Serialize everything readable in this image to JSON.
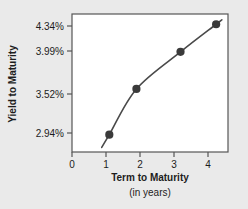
{
  "chart_data": {
    "type": "line",
    "title": "",
    "xlabel": "Term to Maturity",
    "xlabel_sub": "(in years)",
    "ylabel": "Yield to Maturity",
    "x": [
      1.1,
      1.9,
      3.2,
      4.25
    ],
    "y": [
      2.94,
      3.52,
      3.99,
      4.34
    ],
    "point_labels": [
      "2.94%",
      "3.52%",
      "3.99%",
      "4.34%"
    ],
    "xticks": [
      0,
      1,
      2,
      3,
      4
    ],
    "xticklabels": [
      "0",
      "1",
      "2",
      "3",
      "4"
    ],
    "yticks": [
      2.94,
      3.52,
      3.99,
      4.34
    ],
    "yticklabels": [
      "2.94%",
      "3.52%",
      "3.99%",
      "4.34%"
    ],
    "xlim": [
      0,
      4.6
    ],
    "ylim": [
      2.72,
      4.47
    ],
    "grid": false,
    "legend": null,
    "marker": "circle",
    "line_color": "#4a4a4a",
    "marker_color": "#3a3a3a",
    "plot_bg": "#ffffff",
    "figure_bg": "#eaeaea",
    "axis_color": "#555555",
    "text_color": "#1d1d1d"
  },
  "axes": {
    "ytick_0": "2.94%",
    "ytick_1": "3.52%",
    "ytick_2": "3.99%",
    "ytick_3": "4.34%",
    "xtick_0": "0",
    "xtick_1": "1",
    "xtick_2": "2",
    "xtick_3": "3",
    "xtick_4": "4",
    "x_title": "Term to Maturity",
    "x_subtitle": "(in years)",
    "y_title": "Yield to Maturity"
  }
}
